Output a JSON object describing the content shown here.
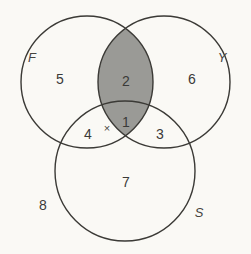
{
  "figure": {
    "background_color": "#faf9f5",
    "stroke_color": "#3b3a36",
    "shade_color": "#9a9a96",
    "text_color": "#3a3a38"
  },
  "sets": [
    {
      "id": "F",
      "label": "F",
      "label_x": 32,
      "label_y": 57
    },
    {
      "id": "Y",
      "label": "Y",
      "label_x": 222,
      "label_y": 57
    },
    {
      "id": "S",
      "label": "S",
      "label_x": 199,
      "label_y": 212
    }
  ],
  "regions": [
    {
      "id": "F-only",
      "label": "5",
      "x": 60,
      "y": 79,
      "shaded": false
    },
    {
      "id": "FY-only",
      "label": "2",
      "x": 126,
      "y": 81,
      "shaded": true
    },
    {
      "id": "Y-only",
      "label": "6",
      "x": 192,
      "y": 79,
      "shaded": false
    },
    {
      "id": "FS-only",
      "label": "4",
      "x": 88,
      "y": 134,
      "shaded": false
    },
    {
      "id": "FYS-center",
      "label": "1",
      "x": 126,
      "y": 122,
      "shaded": true
    },
    {
      "id": "YS-only",
      "label": "3",
      "x": 160,
      "y": 134,
      "shaded": false
    },
    {
      "id": "S-only",
      "label": "7",
      "x": 126,
      "y": 182,
      "shaded": false
    },
    {
      "id": "outside-all",
      "label": "8",
      "x": 43,
      "y": 205,
      "shaded": false
    }
  ],
  "elements": [
    {
      "id": "element-x",
      "label": "×",
      "region": "FS-only",
      "x": 107,
      "y": 128
    }
  ],
  "shaded_description": "Intersection of F and Y (regions 2 and 1) is shaded gray"
}
